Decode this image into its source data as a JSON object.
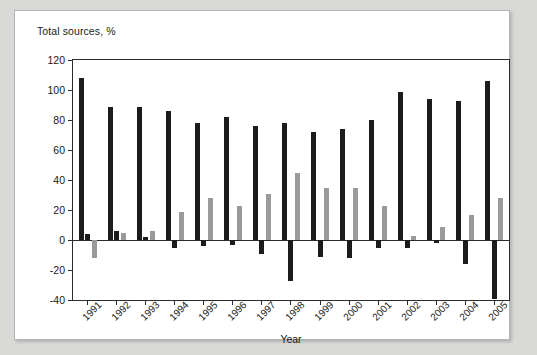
{
  "figure": {
    "y_axis_title": "Total sources, %",
    "x_axis_title": "Year"
  },
  "legend": {
    "items": [
      {
        "label": "Internal funds",
        "color": "#1c1c1c"
      },
      {
        "label": "Net equity issues",
        "color": "#1c1c1c"
      },
      {
        "label": "Net borrowing",
        "color": "#9a9a9a"
      }
    ]
  },
  "chart_data": {
    "type": "bar",
    "title": "",
    "xlabel": "Year",
    "ylabel": "Total sources, %",
    "ylim": [
      -40,
      120
    ],
    "yticks": [
      -40,
      -20,
      0,
      20,
      40,
      60,
      80,
      100,
      120
    ],
    "ytick_labels": [
      "-40",
      "-20",
      "0",
      "20",
      "40",
      "60",
      "80",
      "100",
      "120"
    ],
    "grid": false,
    "legend_position": "top-center",
    "categories": [
      "1991",
      "1992",
      "1993",
      "1994",
      "1995",
      "1996",
      "1997",
      "1998",
      "1999",
      "2000",
      "2001",
      "2002",
      "2003",
      "2004",
      "2005"
    ],
    "series": [
      {
        "name": "Internal funds",
        "color": "#1c1c1c",
        "values": [
          108,
          89,
          89,
          86,
          78,
          82,
          76,
          78,
          72,
          74,
          80,
          99,
          94,
          93,
          106
        ]
      },
      {
        "name": "Net equity issues",
        "color": "#1c1c1c",
        "values": [
          4,
          6,
          2,
          -5,
          -4,
          -3,
          -9,
          -27,
          -11,
          -12,
          -5,
          -5,
          -2,
          -16,
          -39
        ]
      },
      {
        "name": "Net borrowing",
        "color": "#9a9a9a",
        "values": [
          -12,
          5,
          6,
          19,
          28,
          23,
          31,
          45,
          35,
          35,
          23,
          3,
          9,
          17,
          28
        ]
      }
    ]
  }
}
